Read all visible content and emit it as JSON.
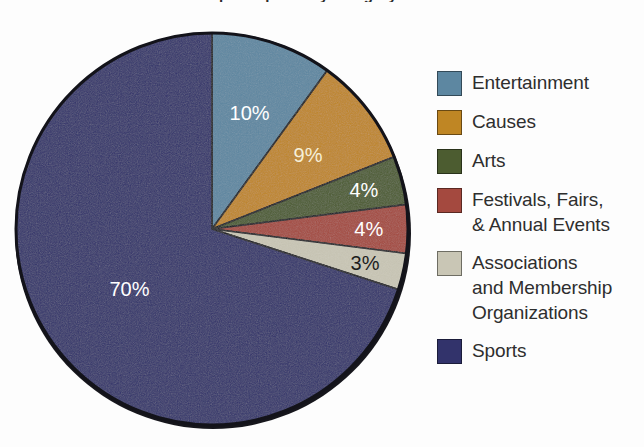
{
  "title": "Share of participants by category",
  "chart_data": {
    "type": "pie",
    "title": "Share of participants by category",
    "xlabel": "",
    "ylabel": "",
    "grid": false,
    "legend_position": "right",
    "units": "percent",
    "start_angle_deg": 0,
    "direction": "clockwise",
    "categories": [
      "Entertainment",
      "Causes",
      "Arts",
      "Festivals, Fairs,\n& Annual Events",
      "Associations\nand Membership\nOrganizations",
      "Sports"
    ],
    "values": [
      10,
      9,
      4,
      4,
      3,
      70
    ],
    "value_labels": [
      "10%",
      "9%",
      "4%",
      "4%",
      "3%",
      "70%"
    ],
    "colors": [
      "#5d87a1",
      "#bf8624",
      "#4c5c30",
      "#a4493f",
      "#c9c6b5",
      "#32336b"
    ],
    "label_colors": [
      "#ffffff",
      "#f6efd8",
      "#ffffff",
      "#ffffff",
      "#1d1d1d",
      "#ffffff"
    ]
  },
  "legend": {
    "items": [
      {
        "label": "Entertainment",
        "color": "#5d87a1",
        "value_label": "10%"
      },
      {
        "label": "Causes",
        "color": "#bf8624",
        "value_label": "9%"
      },
      {
        "label": "Arts",
        "color": "#4c5c30",
        "value_label": "4%"
      },
      {
        "label": "Festivals, Fairs,\n& Annual Events",
        "color": "#a4493f",
        "value_label": "4%"
      },
      {
        "label": "Associations\nand Membership\nOrganizations",
        "color": "#c9c6b5",
        "value_label": "3%"
      },
      {
        "label": "Sports",
        "color": "#32336b",
        "value_label": "70%"
      }
    ]
  }
}
